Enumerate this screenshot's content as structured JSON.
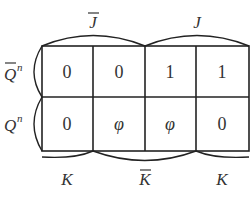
{
  "kmap": {
    "top_labels": [
      {
        "text": "J",
        "bar": true
      },
      {
        "text": "J",
        "bar": false
      }
    ],
    "row_labels": [
      {
        "text": "Q",
        "sup": "n",
        "bar": true
      },
      {
        "text": "Q",
        "sup": "n",
        "bar": false
      }
    ],
    "bottom_labels": [
      {
        "text": "K",
        "bar": false
      },
      {
        "text": "K",
        "bar": true
      },
      {
        "text": "K",
        "bar": false
      }
    ],
    "cells": [
      [
        "0",
        "0",
        "1",
        "1"
      ],
      [
        "0",
        "φ",
        "φ",
        "0"
      ]
    ]
  }
}
